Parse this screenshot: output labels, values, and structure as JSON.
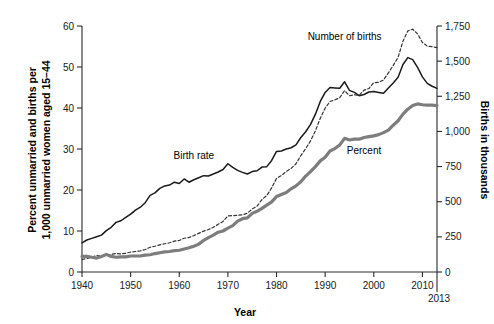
{
  "chart_data": {
    "type": "line",
    "title": "",
    "xlabel": "Year",
    "ylabel": "Percent unmarried and births per 1,000 unmarried women aged 15–44",
    "ylabel_right": "Births in thousands",
    "xlim": [
      1940,
      2013
    ],
    "ylim": [
      0,
      60
    ],
    "ylim_right": [
      0,
      1750
    ],
    "grid": false,
    "legend_position": "inline-annotations",
    "x_ticks": [
      1940,
      1950,
      1960,
      1970,
      1980,
      1990,
      2000,
      2010
    ],
    "x_tick_labels": [
      "1940",
      "1950",
      "1960",
      "1970",
      "1980",
      "1990",
      "2000",
      "2010"
    ],
    "x_end_tick": 2013,
    "x_end_tick_label": "2013",
    "y_ticks": [
      0,
      10,
      20,
      30,
      40,
      50,
      60
    ],
    "y_tick_labels": [
      "0",
      "10",
      "20",
      "30",
      "40",
      "50",
      "60"
    ],
    "y_ticks_right": [
      0,
      250,
      500,
      750,
      1000,
      1250,
      1500,
      1750
    ],
    "y_tick_labels_right": [
      "0",
      "250",
      "500",
      "750",
      "1,000",
      "1,250",
      "1,500",
      "1,750"
    ],
    "x": [
      1940,
      1941,
      1942,
      1943,
      1944,
      1945,
      1946,
      1947,
      1948,
      1949,
      1950,
      1951,
      1952,
      1953,
      1954,
      1955,
      1956,
      1957,
      1958,
      1959,
      1960,
      1961,
      1962,
      1963,
      1964,
      1965,
      1966,
      1967,
      1968,
      1969,
      1970,
      1971,
      1972,
      1973,
      1974,
      1975,
      1976,
      1977,
      1978,
      1979,
      1980,
      1981,
      1982,
      1983,
      1984,
      1985,
      1986,
      1987,
      1988,
      1989,
      1990,
      1991,
      1992,
      1993,
      1994,
      1995,
      1996,
      1997,
      1998,
      1999,
      2000,
      2001,
      2002,
      2003,
      2004,
      2005,
      2006,
      2007,
      2008,
      2009,
      2010,
      2011,
      2012,
      2013
    ],
    "series": [
      {
        "name": "Birth rate",
        "axis": "left",
        "units": "births per 1,000 unmarried women aged 15-44",
        "color": "#1a1a1a",
        "style": "solid",
        "label_x": 1963,
        "label_y": 27.5,
        "values": [
          7.1,
          7.8,
          8.2,
          8.6,
          9.0,
          10.1,
          10.9,
          12.1,
          12.5,
          13.3,
          14.1,
          15.1,
          15.8,
          16.9,
          18.7,
          19.3,
          20.4,
          21.0,
          21.2,
          21.9,
          21.6,
          22.7,
          21.9,
          22.5,
          23.0,
          23.5,
          23.4,
          23.9,
          24.4,
          25.0,
          26.4,
          25.5,
          24.8,
          24.3,
          23.9,
          24.5,
          24.7,
          25.6,
          25.7,
          27.2,
          29.4,
          29.5,
          30.0,
          30.3,
          31.0,
          32.8,
          34.2,
          36.0,
          38.5,
          41.6,
          43.8,
          45.0,
          44.9,
          44.8,
          46.4,
          44.3,
          43.8,
          43.0,
          43.3,
          43.9,
          44.0,
          43.8,
          43.6,
          44.9,
          46.1,
          47.5,
          50.6,
          52.3,
          51.8,
          49.9,
          47.6,
          46.0,
          45.3,
          44.8
        ]
      },
      {
        "name": "Number of births",
        "axis": "right",
        "units": "thousands of births to unmarried women",
        "color": "#333333",
        "style": "dashed",
        "label_x": 1994,
        "label_y": 56.5,
        "values": [
          89,
          96,
          105,
          118,
          112,
          118,
          126,
          131,
          129,
          133,
          142,
          146,
          150,
          160,
          176,
          183,
          193,
          201,
          208,
          220,
          224,
          240,
          245,
          259,
          275,
          291,
          302,
          318,
          339,
          360,
          399,
          401,
          403,
          407,
          418,
          448,
          468,
          516,
          544,
          598,
          666,
          686,
          715,
          737,
          770,
          828,
          878,
          933,
          1005,
          1094,
          1165,
          1213,
          1225,
          1240,
          1290,
          1254,
          1260,
          1257,
          1294,
          1305,
          1347,
          1349,
          1366,
          1416,
          1470,
          1527,
          1642,
          1715,
          1727,
          1694,
          1633,
          1607,
          1603,
          1596
        ]
      },
      {
        "name": "Percent",
        "axis": "left",
        "units": "percent of all births that are to unmarried women",
        "color": "#7d7d7d",
        "style": "solid-thick",
        "label_x": 1998,
        "label_y": 28.8,
        "values": [
          3.8,
          3.8,
          3.6,
          3.4,
          3.8,
          4.3,
          3.8,
          3.6,
          3.7,
          3.7,
          3.9,
          3.9,
          3.9,
          4.1,
          4.2,
          4.5,
          4.7,
          4.9,
          5.0,
          5.2,
          5.3,
          5.6,
          5.9,
          6.3,
          6.8,
          7.7,
          8.4,
          9.0,
          9.7,
          10.0,
          10.7,
          11.3,
          12.4,
          13.0,
          13.2,
          14.3,
          14.8,
          15.5,
          16.3,
          17.1,
          18.4,
          18.9,
          19.4,
          20.3,
          21.0,
          22.0,
          23.4,
          24.5,
          25.7,
          27.1,
          28.0,
          29.5,
          30.1,
          31.0,
          32.6,
          32.2,
          32.4,
          32.4,
          32.8,
          33.0,
          33.2,
          33.5,
          34.0,
          34.6,
          35.8,
          36.9,
          38.5,
          39.7,
          40.6,
          41.0,
          40.8,
          40.7,
          40.7,
          40.6
        ]
      }
    ]
  },
  "annotations": {
    "birth_rate": "Birth rate",
    "number_of_births": "Number of births",
    "percent": "Percent"
  },
  "axes": {
    "x_title": "Year",
    "y_left_title_line1": "Percent unmarried and births per",
    "y_left_title_line2": "1,000 unmarried women aged 15–44",
    "y_right_title": "Births in thousands"
  }
}
